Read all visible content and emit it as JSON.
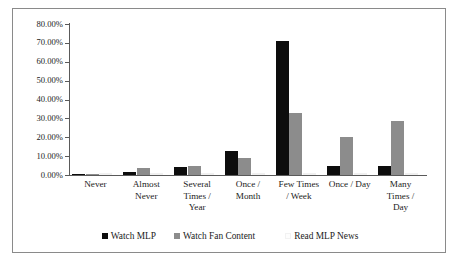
{
  "chart_data": {
    "type": "bar",
    "title": "",
    "subtitle": "",
    "xlabel": "",
    "ylabel": "",
    "ylim": [
      0,
      0.8
    ],
    "grid": false,
    "legend_position": "bottom",
    "categories": [
      "Never",
      "Almost Never",
      "Several Times / Year",
      "Once / Month",
      "Few Times / Week",
      "Once / Day",
      "Many Times / Day"
    ],
    "category_lines": [
      [
        "Never"
      ],
      [
        "Almost",
        "Never"
      ],
      [
        "Several",
        "Times /",
        "Year"
      ],
      [
        "Once /",
        "Month"
      ],
      [
        "Few Times",
        "/ Week"
      ],
      [
        "Once / Day"
      ],
      [
        "Many",
        "Times /",
        "Day"
      ]
    ],
    "ytick_labels": [
      "80.00%",
      "70.00%",
      "60.00%",
      "50.00%",
      "40.00%",
      "30.00%",
      "20.00%",
      "10.00%",
      "0.00%"
    ],
    "ytick_values": [
      0.8,
      0.7,
      0.6,
      0.5,
      0.4,
      0.3,
      0.2,
      0.1,
      0.0
    ],
    "series": [
      {
        "name": "Watch MLP",
        "color": "#0d0d0d",
        "values": [
          0.005,
          0.015,
          0.04,
          0.125,
          0.71,
          0.05,
          0.05
        ]
      },
      {
        "name": "Watch Fan Content",
        "color": "#8c8c8c",
        "values": [
          0.005,
          0.035,
          0.05,
          0.09,
          0.33,
          0.2,
          0.285
        ]
      },
      {
        "name": "Read MLP News",
        "color": "#fcfcfc",
        "values": [
          0.003,
          0.003,
          0.005,
          0.005,
          0.005,
          0.005,
          0.005
        ]
      }
    ]
  },
  "legend": {
    "items": [
      {
        "label": "Watch MLP",
        "swatch": "black-square-icon"
      },
      {
        "label": "Watch Fan Content",
        "swatch": "gray-square-icon"
      },
      {
        "label": "Read MLP News",
        "swatch": "white-square-icon"
      }
    ]
  }
}
